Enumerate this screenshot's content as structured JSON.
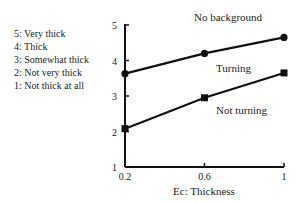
{
  "chart_data": {
    "type": "line",
    "title": "No background",
    "xlabel": "Ec: Thickness",
    "ylabel": "",
    "x": [
      0.2,
      0.6,
      1
    ],
    "x_tick_labels": [
      "0.2",
      "0.6",
      "1"
    ],
    "y_ticks": [
      1,
      2,
      3,
      4,
      5
    ],
    "y_tick_labels": [
      "1",
      "2",
      "3",
      "4",
      "5"
    ],
    "xlim": [
      0.2,
      1
    ],
    "ylim": [
      1,
      5
    ],
    "grid": false,
    "series": [
      {
        "name": "Turning",
        "marker": "circle",
        "values": [
          3.63,
          4.2,
          4.65
        ]
      },
      {
        "name": "Not turning",
        "marker": "square",
        "values": [
          2.08,
          2.95,
          3.65
        ]
      }
    ],
    "scale_legend": [
      "5: Very thick",
      "4: Thick",
      "3: Somewhat thick",
      "2: Not very thick",
      "1: Not thick at all"
    ],
    "legend_position": "left"
  }
}
